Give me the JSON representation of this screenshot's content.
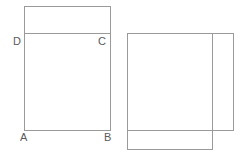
{
  "figure": {
    "canvas": {
      "width": 248,
      "height": 155,
      "background": "#ffffff"
    },
    "stroke": {
      "color": "#9a9a9a",
      "width": 1
    },
    "label_color": "#5a5a5a",
    "label_font_size": 11,
    "shapes": [
      {
        "name": "upper-left-rectangle",
        "type": "rectangle",
        "x": 24,
        "y": 6,
        "width": 86,
        "height": 27
      },
      {
        "name": "square-abcd",
        "type": "rectangle",
        "x": 24,
        "y": 33,
        "width": 86,
        "height": 97
      },
      {
        "name": "right-upper-rectangle",
        "type": "rectangle",
        "x": 127,
        "y": 33,
        "width": 106,
        "height": 97
      },
      {
        "name": "right-lower-rectangle",
        "type": "rectangle",
        "x": 127,
        "y": 33,
        "width": 85,
        "height": 116
      }
    ],
    "vertex_labels": [
      {
        "name": "vertex-label-d",
        "text": "D",
        "x": 13,
        "y": 36
      },
      {
        "name": "vertex-label-c",
        "text": "C",
        "x": 98,
        "y": 36
      },
      {
        "name": "vertex-label-a",
        "text": "A",
        "x": 20,
        "y": 132
      },
      {
        "name": "vertex-label-b",
        "text": "B",
        "x": 104,
        "y": 132
      }
    ]
  }
}
